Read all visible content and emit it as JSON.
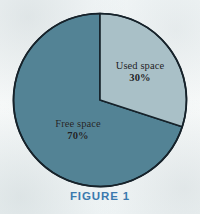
{
  "figure": {
    "caption": "FIGURE 1",
    "caption_color": "#3a79ae",
    "background_color": "#f7fafa"
  },
  "chart_data": {
    "type": "pie",
    "title": "",
    "subtitle": "",
    "xlabel": "",
    "ylabel": "",
    "legend_position": "none",
    "grid": false,
    "start_angle_deg": 0,
    "direction": "clockwise",
    "categories": [
      "Used space",
      "Free space"
    ],
    "values": [
      30,
      70
    ],
    "units": "percent",
    "slices": [
      {
        "label": "Used space",
        "value": 30,
        "value_text": "30%",
        "color": "#a9c0c7",
        "start_angle_deg": 0,
        "end_angle_deg": 108
      },
      {
        "label": "Free space",
        "value": 70,
        "value_text": "70%",
        "color": "#538395",
        "start_angle_deg": 108,
        "end_angle_deg": 360
      }
    ],
    "outline_color": "#16222a",
    "annotations": [
      "Used space 30%",
      "Free space 70%"
    ]
  }
}
